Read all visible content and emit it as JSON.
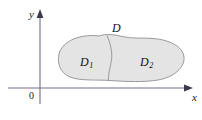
{
  "figure": {
    "caption_type": "region-decomposition-diagram",
    "axes": {
      "x_label": "x",
      "y_label": "y",
      "origin_label": "0",
      "x_axis_arrow": "arrow-right",
      "y_axis_arrow": "arrow-up"
    },
    "labels": {
      "whole_region": "D",
      "subregion_left": "D",
      "subregion_left_sub": "1",
      "subregion_right": "D",
      "subregion_right_sub": "2"
    },
    "colors": {
      "region_fill": "#e4e4e4",
      "region_stroke": "#9a9a9a",
      "divider_stroke": "#9a9a9a",
      "axis_stroke": "#6e6e8a",
      "text": "#1a1a1a",
      "background": "#ffffff"
    }
  }
}
